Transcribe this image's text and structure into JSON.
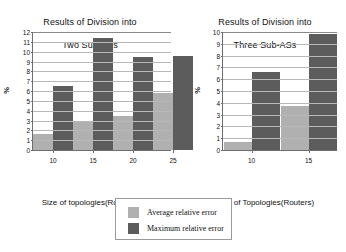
{
  "figure": {
    "legend": {
      "position": "bottom-center",
      "entries": [
        {
          "label": "Average relative error",
          "color": "#b0b0b0",
          "series": "average"
        },
        {
          "label": "Maximum relative error",
          "color": "#5c5c5c",
          "series": "maximum"
        }
      ]
    }
  },
  "chart_data": [
    {
      "type": "bar",
      "id": "two-sub-as",
      "title": "Results of Division into\nTwo Sub-ASs",
      "title_line1": "Results of Division into",
      "title_line2": "Two Sub-ASs",
      "xlabel": "Size of topologies(Routers)",
      "ylabel": "%",
      "categories": [
        "10",
        "15",
        "20",
        "25"
      ],
      "ylim": [
        0,
        12
      ],
      "yticks": [
        0,
        1,
        2,
        3,
        4,
        5,
        6,
        7,
        8,
        9,
        10,
        11,
        12
      ],
      "grid": true,
      "series": [
        {
          "name": "Average relative error",
          "color": "#b0b0b0",
          "values": [
            1.6,
            2.95,
            3.5,
            5.8
          ]
        },
        {
          "name": "Maximum relative error",
          "color": "#5c5c5c",
          "values": [
            6.5,
            11.4,
            9.5,
            9.6
          ]
        }
      ]
    },
    {
      "type": "bar",
      "id": "three-sub-as",
      "title": "Results of Division into\nThree Sub-ASs",
      "title_line1": "Results of Division into",
      "title_line2": "Three Sub-ASs",
      "xlabel": "Size of Topologies(Routers)",
      "ylabel": "%",
      "categories": [
        "10",
        "15"
      ],
      "ylim": [
        0,
        10
      ],
      "yticks": [
        0,
        1,
        2,
        3,
        4,
        5,
        6,
        7,
        8,
        9,
        10
      ],
      "grid": true,
      "series": [
        {
          "name": "Average relative error",
          "color": "#b0b0b0",
          "values": [
            0.65,
            3.7
          ]
        },
        {
          "name": "Maximum relative error",
          "color": "#5c5c5c",
          "values": [
            6.6,
            9.8
          ]
        }
      ]
    }
  ]
}
